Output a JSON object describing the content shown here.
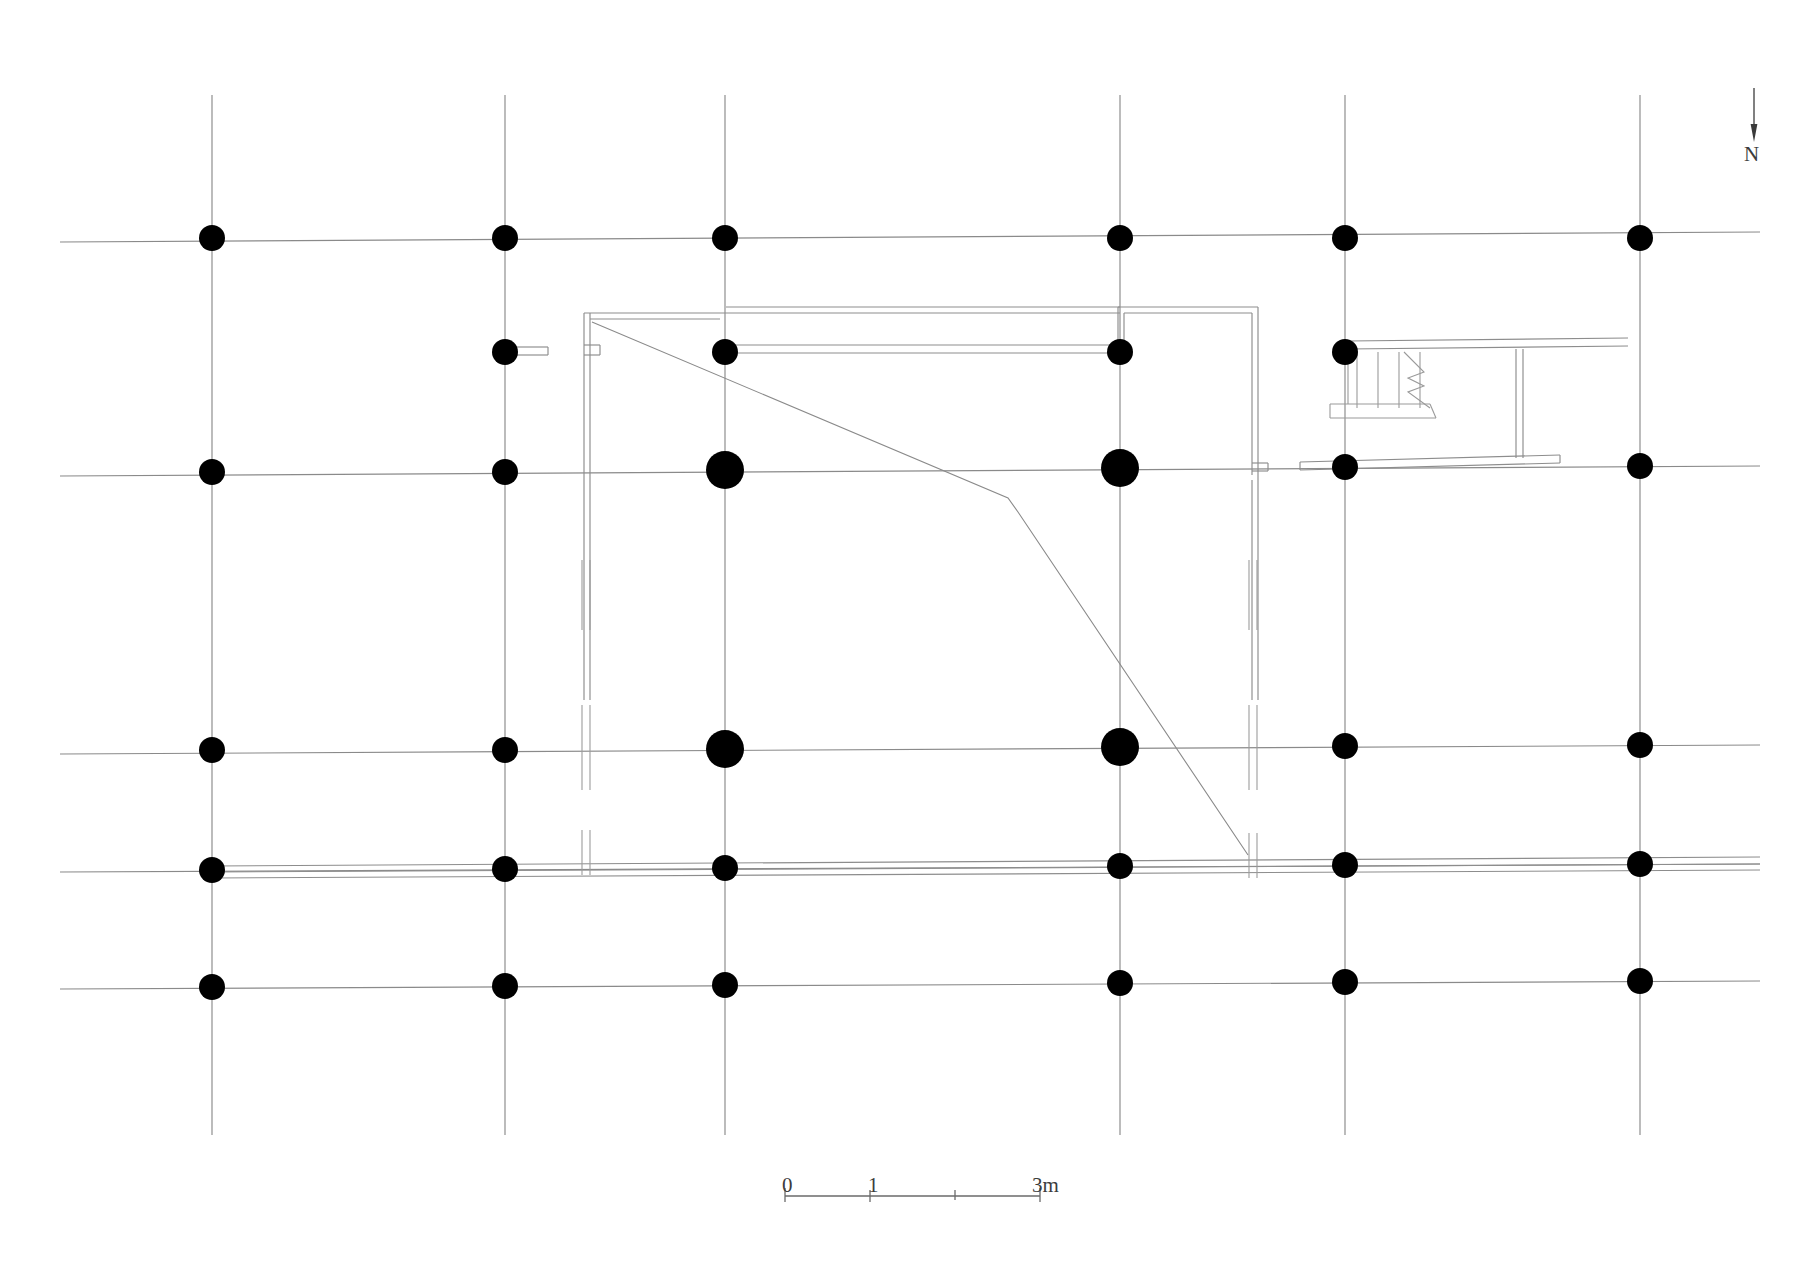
{
  "drawing": {
    "kind": "architectural-floor-plan",
    "title_partial": "",
    "background_color": "#ffffff",
    "line_color": "#6e6e6e",
    "column_color": "#000000",
    "wall_color": "#777777"
  },
  "north_arrow": {
    "label": "N",
    "direction": "down",
    "shaft_x": 1754,
    "shaft_top": 88,
    "shaft_bottom": 130,
    "head_bottom": 140
  },
  "scale_bar": {
    "label_0": "0",
    "label_1": "1",
    "label_3m": "3m",
    "x_start": 785,
    "x_end": 1040,
    "y": 1196,
    "ticks": [
      785,
      870,
      955,
      1040
    ],
    "units": "m",
    "max_value": 3
  },
  "grid": {
    "vertical_lines_x": [
      212,
      505,
      725,
      1120,
      1345,
      1640
    ],
    "horizontal_lines_y": [
      238,
      472,
      750,
      868,
      985
    ],
    "vertical_extent": [
      95,
      1135
    ],
    "horizontal_extent": [
      60,
      1760
    ]
  },
  "columns": {
    "standard_radius": 13,
    "large_radius": 19,
    "positions": [
      {
        "x": 212,
        "y": 238,
        "size": "standard"
      },
      {
        "x": 505,
        "y": 238,
        "size": "standard"
      },
      {
        "x": 725,
        "y": 238,
        "size": "standard"
      },
      {
        "x": 1120,
        "y": 238,
        "size": "standard"
      },
      {
        "x": 1345,
        "y": 238,
        "size": "standard"
      },
      {
        "x": 1640,
        "y": 238,
        "size": "standard"
      },
      {
        "x": 505,
        "y": 352,
        "size": "standard"
      },
      {
        "x": 725,
        "y": 352,
        "size": "standard"
      },
      {
        "x": 1120,
        "y": 352,
        "size": "standard"
      },
      {
        "x": 1345,
        "y": 352,
        "size": "standard"
      },
      {
        "x": 212,
        "y": 472,
        "size": "standard"
      },
      {
        "x": 505,
        "y": 472,
        "size": "standard"
      },
      {
        "x": 725,
        "y": 472,
        "size": "large"
      },
      {
        "x": 1120,
        "y": 472,
        "size": "large"
      },
      {
        "x": 1345,
        "y": 472,
        "size": "standard"
      },
      {
        "x": 1640,
        "y": 472,
        "size": "standard"
      },
      {
        "x": 212,
        "y": 750,
        "size": "standard"
      },
      {
        "x": 505,
        "y": 750,
        "size": "standard"
      },
      {
        "x": 725,
        "y": 750,
        "size": "large"
      },
      {
        "x": 1120,
        "y": 750,
        "size": "large"
      },
      {
        "x": 1345,
        "y": 750,
        "size": "standard"
      },
      {
        "x": 1640,
        "y": 750,
        "size": "standard"
      },
      {
        "x": 212,
        "y": 868,
        "size": "standard"
      },
      {
        "x": 505,
        "y": 868,
        "size": "standard"
      },
      {
        "x": 725,
        "y": 868,
        "size": "standard"
      },
      {
        "x": 1120,
        "y": 868,
        "size": "standard"
      },
      {
        "x": 1345,
        "y": 868,
        "size": "standard"
      },
      {
        "x": 1640,
        "y": 868,
        "size": "standard"
      },
      {
        "x": 212,
        "y": 985,
        "size": "standard"
      },
      {
        "x": 505,
        "y": 985,
        "size": "standard"
      },
      {
        "x": 725,
        "y": 985,
        "size": "standard"
      },
      {
        "x": 1120,
        "y": 985,
        "size": "standard"
      },
      {
        "x": 1345,
        "y": 985,
        "size": "standard"
      },
      {
        "x": 1640,
        "y": 985,
        "size": "standard"
      }
    ]
  },
  "staircase": {
    "tread_count": 4,
    "break_line": true,
    "landing": true,
    "x_left": 1350,
    "x_right": 1425,
    "y_top": 355,
    "y_bottom": 412
  },
  "annotations": {
    "diagonal_sightline": "corner-to-wall diagonal",
    "dashed_walls": "hidden / removed wall segments"
  }
}
